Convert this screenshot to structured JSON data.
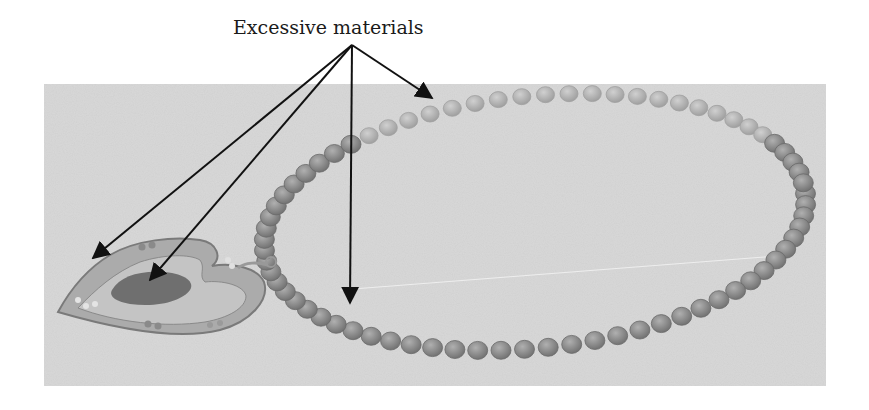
{
  "figure": {
    "annotation_label": "Excessive materials",
    "colors": {
      "background": "#ffffff",
      "panel": "#d9d9d9",
      "bead_fill": "#8f8f8f",
      "bead_light": "#b5b5b5",
      "pendant_fill": "#a9a9a9",
      "pendant_inner": "#6f6f6f",
      "arrow": "#111111"
    },
    "arrows": [
      {
        "name": "arrow-to-chain-top",
        "from": [
          352,
          45
        ],
        "to": [
          432,
          98
        ]
      },
      {
        "name": "arrow-to-pendant-edge",
        "from": [
          352,
          45
        ],
        "to": [
          93,
          258
        ]
      },
      {
        "name": "arrow-to-pendant-inner",
        "from": [
          352,
          45
        ],
        "to": [
          150,
          280
        ]
      },
      {
        "name": "arrow-to-chain-bottom",
        "from": [
          352,
          45
        ],
        "to": [
          350,
          303
        ]
      }
    ]
  }
}
